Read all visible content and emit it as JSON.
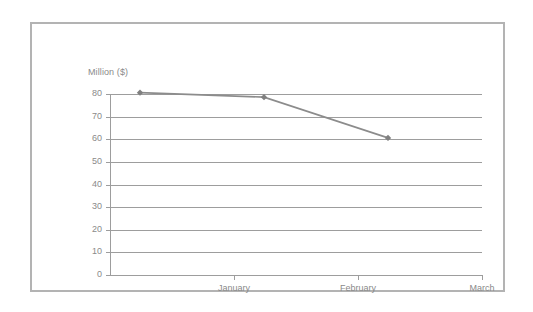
{
  "chart_data": {
    "type": "line",
    "title": "",
    "subtitle": "",
    "xlabel": "",
    "ylabel": "Million ($)",
    "categories": [
      "January",
      "February",
      "March"
    ],
    "x_tick_labels": [
      "January",
      "February",
      "March"
    ],
    "y_tick_labels": [
      "0",
      "10",
      "20",
      "30",
      "40",
      "50",
      "60",
      "70",
      "80"
    ],
    "y_ticks": [
      0,
      10,
      20,
      30,
      40,
      50,
      60,
      70,
      80
    ],
    "ylim": [
      0,
      80
    ],
    "grid": "horizontal",
    "legend": "none",
    "series": [
      {
        "name": "Series 1",
        "points": [
          {
            "x": 0.5,
            "label": "",
            "value": 70
          },
          {
            "x": 1.5,
            "label": "",
            "value": 68
          },
          {
            "x": 2.5,
            "label": "",
            "value": 50
          }
        ],
        "values": [
          70,
          68,
          50
        ],
        "marker": "diamond",
        "line_color": "#8c8c8c",
        "marker_color": "#808080"
      }
    ]
  },
  "style": {
    "frame_border_color": "#b3b3b3",
    "gridline_color": "#9d9d9d",
    "axis_color": "#9d9d9d",
    "tick_text_color": "#8a8a8a",
    "background_color": "#ffffff"
  }
}
